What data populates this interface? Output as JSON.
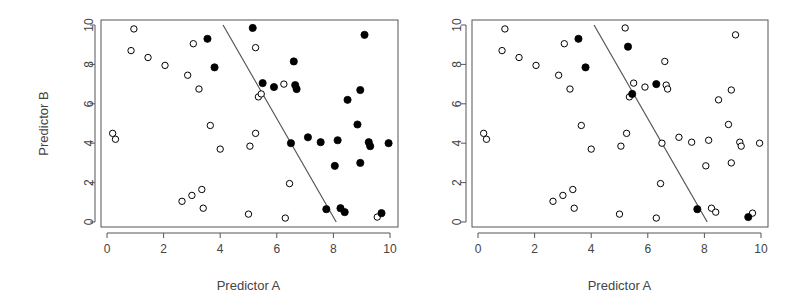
{
  "chart_data": [
    {
      "type": "scatter",
      "title": "",
      "xlabel": "Predictor A",
      "ylabel": "Predictor B",
      "xlim": [
        0,
        10
      ],
      "ylim": [
        0,
        10
      ],
      "xticks": [
        0,
        2,
        4,
        6,
        8,
        10
      ],
      "yticks": [
        0,
        2,
        4,
        6,
        8,
        10
      ],
      "grid": false,
      "legend": null,
      "decision_line": {
        "x": [
          4.1,
          8.1
        ],
        "y": [
          10,
          0
        ]
      },
      "series": [
        {
          "name": "open",
          "marker": "open-circle",
          "points": [
            [
              0.2,
              4.5
            ],
            [
              0.3,
              4.2
            ],
            [
              0.85,
              8.7
            ],
            [
              0.95,
              9.8
            ],
            [
              1.45,
              8.35
            ],
            [
              2.05,
              7.95
            ],
            [
              2.65,
              1.05
            ],
            [
              2.85,
              7.45
            ],
            [
              3.0,
              1.35
            ],
            [
              3.05,
              9.05
            ],
            [
              3.25,
              6.75
            ],
            [
              3.35,
              1.65
            ],
            [
              3.4,
              0.7
            ],
            [
              3.65,
              4.9
            ],
            [
              4.0,
              3.7
            ],
            [
              5.0,
              0.4
            ],
            [
              5.05,
              3.85
            ],
            [
              5.25,
              4.5
            ],
            [
              5.25,
              8.85
            ],
            [
              5.35,
              6.35
            ],
            [
              5.45,
              6.5
            ],
            [
              6.25,
              7.0
            ],
            [
              6.3,
              0.2
            ],
            [
              6.45,
              1.95
            ],
            [
              9.55,
              0.25
            ]
          ]
        },
        {
          "name": "filled",
          "marker": "filled-circle",
          "points": [
            [
              3.55,
              9.3
            ],
            [
              3.8,
              7.85
            ],
            [
              5.15,
              9.85
            ],
            [
              5.5,
              7.05
            ],
            [
              5.9,
              6.85
            ],
            [
              6.5,
              4.0
            ],
            [
              6.6,
              8.15
            ],
            [
              6.65,
              6.95
            ],
            [
              6.7,
              6.75
            ],
            [
              7.1,
              4.3
            ],
            [
              7.55,
              4.05
            ],
            [
              7.75,
              0.65
            ],
            [
              8.05,
              2.85
            ],
            [
              8.15,
              4.15
            ],
            [
              8.25,
              0.7
            ],
            [
              8.4,
              0.5
            ],
            [
              8.5,
              6.2
            ],
            [
              8.85,
              4.95
            ],
            [
              8.95,
              6.7
            ],
            [
              8.95,
              3.0
            ],
            [
              9.1,
              9.5
            ],
            [
              9.25,
              4.05
            ],
            [
              9.3,
              3.85
            ],
            [
              9.7,
              0.45
            ],
            [
              9.95,
              4.0
            ]
          ]
        }
      ]
    },
    {
      "type": "scatter",
      "title": "",
      "xlabel": "Predictor A",
      "ylabel": "",
      "xlim": [
        0,
        10
      ],
      "ylim": [
        0,
        10
      ],
      "xticks": [
        0,
        2,
        4,
        6,
        8,
        10
      ],
      "yticks": [
        0,
        2,
        4,
        6,
        8,
        10
      ],
      "grid": false,
      "legend": null,
      "decision_line": {
        "x": [
          4.1,
          8.1
        ],
        "y": [
          10,
          0
        ]
      },
      "series": [
        {
          "name": "open",
          "marker": "open-circle",
          "points": [
            [
              0.2,
              4.5
            ],
            [
              0.3,
              4.2
            ],
            [
              0.85,
              8.7
            ],
            [
              0.95,
              9.8
            ],
            [
              1.45,
              8.35
            ],
            [
              2.05,
              7.95
            ],
            [
              2.65,
              1.05
            ],
            [
              2.85,
              7.45
            ],
            [
              3.0,
              1.35
            ],
            [
              3.05,
              9.05
            ],
            [
              3.25,
              6.75
            ],
            [
              3.35,
              1.65
            ],
            [
              3.4,
              0.7
            ],
            [
              3.65,
              4.9
            ],
            [
              4.0,
              3.7
            ],
            [
              5.0,
              0.4
            ],
            [
              5.05,
              3.85
            ],
            [
              5.2,
              9.85
            ],
            [
              5.25,
              4.5
            ],
            [
              5.35,
              6.35
            ],
            [
              5.5,
              7.05
            ],
            [
              5.9,
              6.85
            ],
            [
              6.3,
              0.2
            ],
            [
              6.45,
              1.95
            ],
            [
              6.5,
              4.0
            ],
            [
              6.6,
              8.15
            ],
            [
              6.65,
              6.95
            ],
            [
              6.7,
              6.75
            ],
            [
              7.1,
              4.3
            ],
            [
              7.55,
              4.05
            ],
            [
              8.05,
              2.85
            ],
            [
              8.15,
              4.15
            ],
            [
              8.25,
              0.7
            ],
            [
              8.4,
              0.5
            ],
            [
              8.5,
              6.2
            ],
            [
              8.85,
              4.95
            ],
            [
              8.95,
              6.7
            ],
            [
              8.95,
              3.0
            ],
            [
              9.1,
              9.5
            ],
            [
              9.25,
              4.05
            ],
            [
              9.3,
              3.85
            ],
            [
              9.7,
              0.45
            ],
            [
              9.95,
              4.0
            ]
          ]
        },
        {
          "name": "filled",
          "marker": "filled-circle",
          "points": [
            [
              3.55,
              9.3
            ],
            [
              3.8,
              7.85
            ],
            [
              5.3,
              8.9
            ],
            [
              5.45,
              6.5
            ],
            [
              6.3,
              7.0
            ],
            [
              7.75,
              0.65
            ],
            [
              9.55,
              0.25
            ]
          ]
        }
      ]
    }
  ],
  "panels": [
    {
      "xlabel": "Predictor A",
      "ylabel": "Predictor B"
    },
    {
      "xlabel": "Predictor A",
      "ylabel": ""
    }
  ]
}
